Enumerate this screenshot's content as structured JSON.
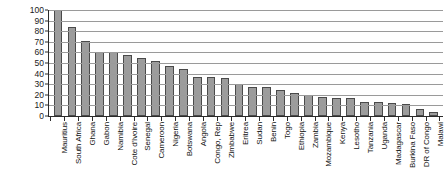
{
  "chart_data": {
    "type": "bar",
    "title": "",
    "subtitle": "",
    "xlabel": "",
    "ylabel": "",
    "ylim": [
      0,
      100
    ],
    "yticks": [
      0,
      10,
      20,
      30,
      40,
      50,
      60,
      70,
      80,
      90,
      100
    ],
    "ytick_labels": [
      "0",
      "10",
      "20",
      "30",
      "40",
      "50",
      "60",
      "70",
      "80",
      "90",
      "100"
    ],
    "grid": true,
    "legend": "none",
    "orientation": "vertical",
    "bar_color": "#9c9c9c",
    "bar_edge_color": "#4a4a4a",
    "categories": [
      "Mauritius",
      "South Africa",
      "Ghana",
      "Gabon",
      "Namibia",
      "Cote d'Ivoire",
      "Senegal",
      "Cameroon",
      "Nigeria",
      "Botswana",
      "Angola",
      "Congo, Rep",
      "Zimbabwe",
      "Eritrea",
      "Sudan",
      "Benin",
      "Togo",
      "Ethiopia",
      "Zambia",
      "Mozambique",
      "Kenya",
      "Lesotho",
      "Tanzania",
      "Uganda",
      "Madagascar",
      "Burkina Faso",
      "DR of Congo",
      "Malawi"
    ],
    "values": [
      100,
      84,
      71,
      60,
      60,
      58,
      55,
      52,
      47,
      44,
      37,
      37,
      36,
      30,
      27,
      27,
      25,
      22,
      20,
      18,
      17,
      17,
      13,
      13,
      12,
      11,
      7,
      4
    ]
  }
}
